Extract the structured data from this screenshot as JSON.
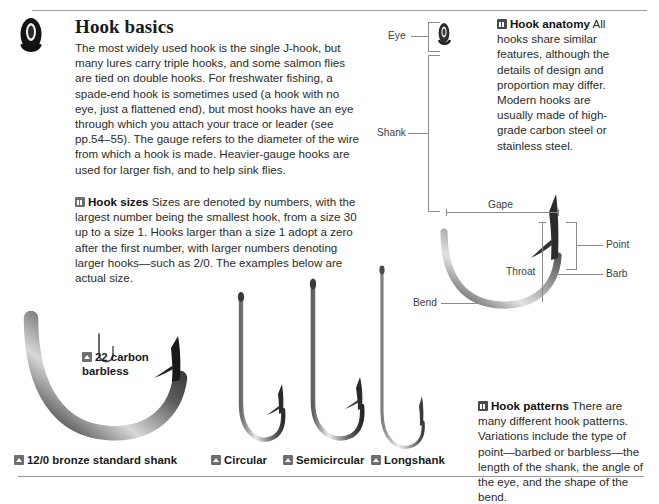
{
  "page": {
    "title": "Hook basics",
    "accent_line_color": "#9b9b9b"
  },
  "sections": {
    "intro": {
      "heading": "Hook basics",
      "body": "The most widely used hook is the single J-hook, but many lures carry triple hooks, and some salmon flies are tied on double hooks. For freshwater fishing, a spade-end hook is sometimes used (a hook with no eye, just a flattened end), but most hooks have an eye through which you attach your trace or leader (see pp.54–55). The gauge refers to the diameter of the wire from which a hook is made. Heavier-gauge hooks are used for larger fish, and to help sink flies."
    },
    "hook_sizes": {
      "icon": "grid-square-icon",
      "lead": "Hook sizes",
      "body": " Sizes are denoted by numbers, with the largest number being the smallest hook, from a size 30 up to a size 1. Hooks larger than a size 1 adopt a zero after the first number, with larger numbers denoting larger hooks—such as 2/0. The examples below are actual size."
    },
    "hook_anatomy": {
      "icon": "grid-square-icon",
      "lead": "Hook anatomy",
      "body": " All hooks share similar features, although the details of design and proportion may differ. Modern hooks are usually made of high-grade carbon steel or stainless steel."
    },
    "hook_patterns": {
      "icon": "grid-square-icon",
      "lead": "Hook patterns",
      "body": " There are many different hook patterns. Variations include the type of point—barbed or barbless—the length of the shank, the angle of the eye, and the shape of the bend."
    }
  },
  "anatomy_labels": {
    "eye": "Eye",
    "shank": "Shank",
    "gape": "Gape",
    "throat": "Throat",
    "point": "Point",
    "barb": "Barb",
    "bend": "Bend"
  },
  "specimens": [
    {
      "id": "carbon-barbless",
      "icon": "photo-icon",
      "label": "22 carbon barbless"
    },
    {
      "id": "bronze-standard-shank",
      "icon": "photo-icon",
      "label": "12/0 bronze standard shank"
    },
    {
      "id": "circular",
      "icon": "photo-icon",
      "label": "Circular"
    },
    {
      "id": "semicircular",
      "icon": "photo-icon",
      "label": "Semicircular"
    },
    {
      "id": "longshank",
      "icon": "photo-icon",
      "label": "Longshank"
    }
  ]
}
